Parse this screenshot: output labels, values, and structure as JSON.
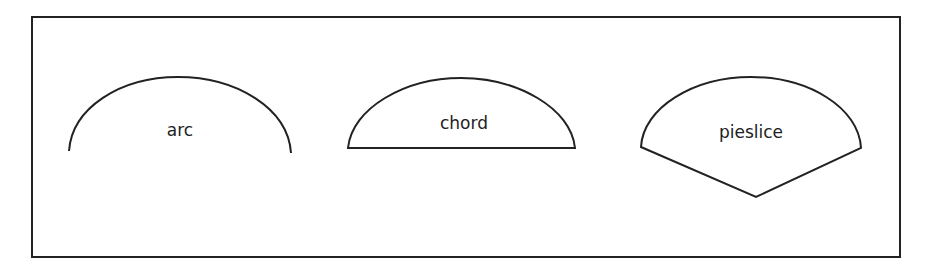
{
  "diagram": {
    "stroke_color": "#222222",
    "background": "#ffffff",
    "shapes": [
      {
        "type": "arc",
        "label": "arc"
      },
      {
        "type": "chord",
        "label": "chord"
      },
      {
        "type": "pieslice",
        "label": "pieslice"
      }
    ]
  }
}
